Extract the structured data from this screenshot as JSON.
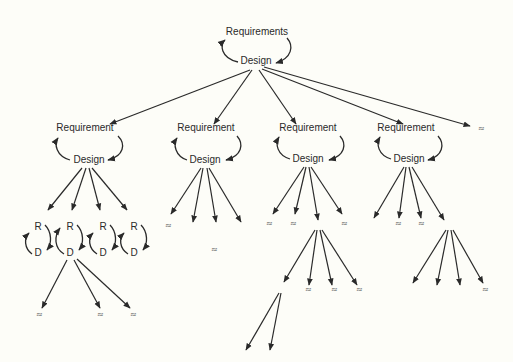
{
  "diagram": {
    "root": {
      "top": "Requirements",
      "bottom": "Design"
    },
    "level2": [
      {
        "top": "Requirement",
        "bottom": "Design"
      },
      {
        "top": "Requirement",
        "bottom": "Design"
      },
      {
        "top": "Requirement",
        "bottom": "Design"
      },
      {
        "top": "Requirement",
        "bottom": "Design"
      }
    ],
    "small_cycles": [
      {
        "top": "R",
        "bottom": "D"
      },
      {
        "top": "R",
        "bottom": "D"
      },
      {
        "top": "R",
        "bottom": "D"
      },
      {
        "top": "R",
        "bottom": "D"
      }
    ],
    "continuation_symbol": "≈"
  }
}
